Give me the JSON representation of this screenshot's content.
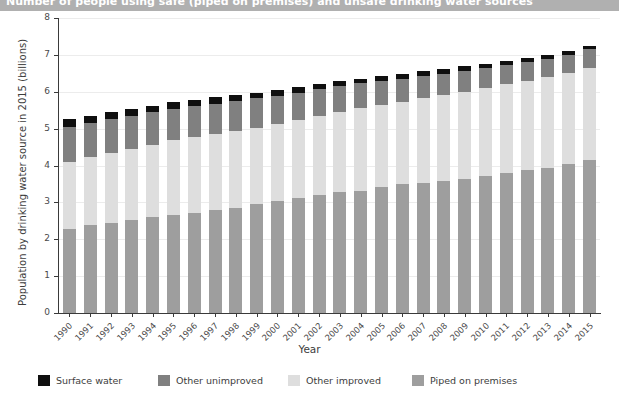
{
  "titlebar": {
    "text": "Number of people using safe (piped on premises) and unsafe drinking water sources"
  },
  "axes": {
    "ylabel": "Population by drinking water source in 2015 (billions)",
    "xlabel": "Year",
    "yticks": [
      "0",
      "1",
      "2",
      "3",
      "4",
      "5",
      "6",
      "7",
      "8"
    ],
    "ylim": [
      0,
      8
    ]
  },
  "legend": {
    "items": [
      {
        "label": "Surface water",
        "color": "#0f0f0f"
      },
      {
        "label": "Other unimproved",
        "color": "#808080"
      },
      {
        "label": "Other improved",
        "color": "#dedede"
      },
      {
        "label": "Piped on premises",
        "color": "#9e9e9e"
      }
    ]
  },
  "chart_data": {
    "type": "bar",
    "stacked": true,
    "title": "Number of people using safe (piped on premises) and unsafe drinking water sources",
    "xlabel": "Year",
    "ylabel": "Population by drinking water source in 2015 (billions)",
    "ylim": [
      0,
      8
    ],
    "grid": true,
    "legend_position": "bottom",
    "categories": [
      "1990",
      "1991",
      "1992",
      "1993",
      "1994",
      "1995",
      "1996",
      "1997",
      "1998",
      "1999",
      "2000",
      "2001",
      "2002",
      "2003",
      "2004",
      "2005",
      "2006",
      "2007",
      "2008",
      "2009",
      "2010",
      "2011",
      "2012",
      "2013",
      "2014",
      "2015"
    ],
    "series": [
      {
        "name": "Piped on premises",
        "color": "#9e9e9e",
        "values": [
          2.28,
          2.38,
          2.45,
          2.52,
          2.6,
          2.66,
          2.72,
          2.8,
          2.86,
          2.95,
          3.05,
          3.12,
          3.2,
          3.27,
          3.32,
          3.42,
          3.5,
          3.52,
          3.58,
          3.64,
          3.72,
          3.8,
          3.88,
          3.94,
          4.04,
          4.15
        ]
      },
      {
        "name": "Other improved",
        "color": "#dedede",
        "values": [
          1.82,
          1.84,
          1.88,
          1.93,
          1.96,
          2.02,
          2.05,
          2.05,
          2.08,
          2.08,
          2.08,
          2.12,
          2.15,
          2.18,
          2.23,
          2.22,
          2.22,
          2.3,
          2.32,
          2.36,
          2.38,
          2.4,
          2.42,
          2.46,
          2.48,
          2.5
        ]
      },
      {
        "name": "Other unimproved",
        "color": "#808080",
        "values": [
          0.95,
          0.93,
          0.92,
          0.9,
          0.88,
          0.86,
          0.85,
          0.83,
          0.81,
          0.79,
          0.76,
          0.74,
          0.72,
          0.7,
          0.68,
          0.65,
          0.63,
          0.61,
          0.59,
          0.57,
          0.55,
          0.53,
          0.51,
          0.49,
          0.48,
          0.5
        ]
      },
      {
        "name": "Surface water",
        "color": "#0f0f0f",
        "values": [
          0.2,
          0.2,
          0.19,
          0.19,
          0.18,
          0.18,
          0.17,
          0.17,
          0.16,
          0.16,
          0.15,
          0.15,
          0.14,
          0.14,
          0.13,
          0.13,
          0.13,
          0.12,
          0.12,
          0.12,
          0.11,
          0.11,
          0.11,
          0.11,
          0.1,
          0.1
        ]
      }
    ],
    "totals": [
      5.25,
      5.35,
      5.44,
      5.54,
      5.62,
      5.72,
      5.79,
      5.85,
      5.91,
      5.98,
      6.04,
      6.13,
      6.21,
      6.29,
      6.36,
      6.42,
      6.48,
      6.55,
      6.61,
      6.69,
      6.76,
      6.84,
      6.92,
      7.0,
      7.1,
      7.25
    ]
  }
}
